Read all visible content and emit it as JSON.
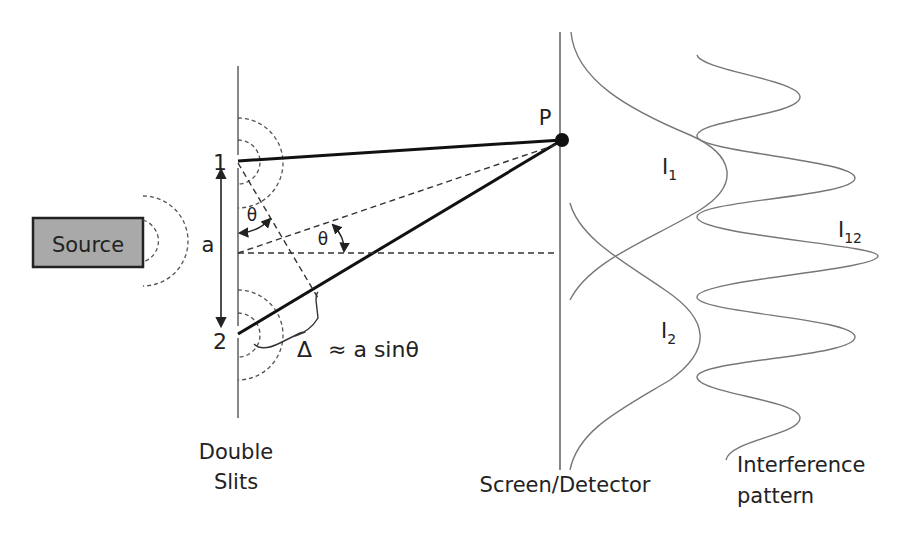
{
  "diagram": {
    "source": {
      "label": "Source",
      "fill": "#a9a9a9"
    },
    "slits": {
      "slit_1_label": "1",
      "slit_2_label": "2",
      "separation_label": "a",
      "caption_line1": "Double",
      "caption_line2": "Slits"
    },
    "angles": {
      "theta_at_slit": "θ",
      "theta_at_center": "θ"
    },
    "path_difference": {
      "symbol": "Δ",
      "formula": "≈ a sinθ"
    },
    "screen": {
      "point_label": "P",
      "caption": "Screen/Detector"
    },
    "intensities": {
      "i1_base": "I",
      "i1_sub": "1",
      "i2_base": "I",
      "i2_sub": "2",
      "i12_base": "I",
      "i12_sub": "12"
    },
    "pattern": {
      "caption_line1": "Interference",
      "caption_line2": "pattern"
    }
  }
}
